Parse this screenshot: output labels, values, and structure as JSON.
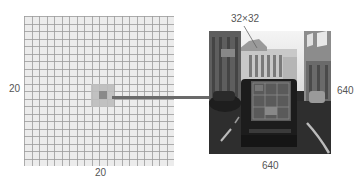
{
  "figure": {
    "grid": {
      "rows": 20,
      "cols": 20,
      "label_left": "20",
      "label_bottom": "20",
      "highlight_cell": {
        "row": 11,
        "col": 10
      },
      "highlight_region_cells": 3
    },
    "image": {
      "label_right": "640",
      "label_bottom": "640",
      "patch_label": "32×32",
      "description": "street scene with van rear"
    },
    "colors": {
      "grid_bg": "#ececec",
      "grid_line": "#9a9a9a",
      "patch_outer": "#bdbdbd",
      "patch_inner": "#8a8a8a",
      "connector": "#6a6a6a",
      "text": "#555555"
    }
  }
}
